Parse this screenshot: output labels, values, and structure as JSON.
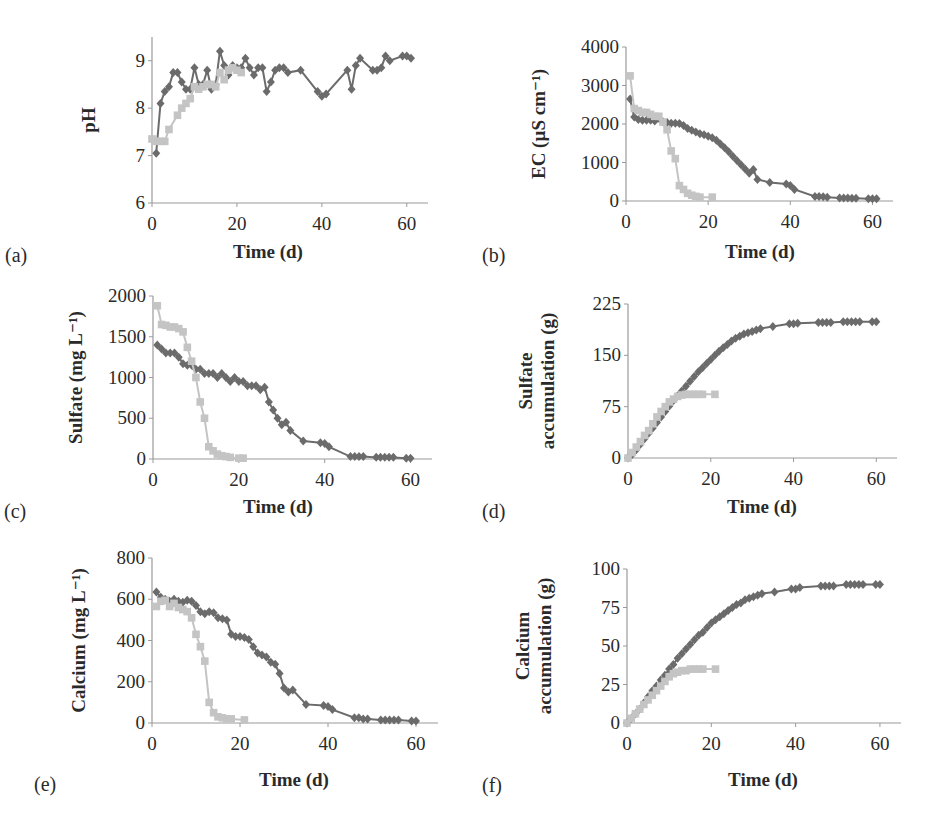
{
  "figure": {
    "series_styles": {
      "series1": {
        "color": "#6b6b6b",
        "marker": "diamond"
      },
      "series2": {
        "color": "#c4c4c4",
        "marker": "square"
      }
    }
  },
  "chart_data": [
    {
      "panel": "(a)",
      "type": "line",
      "title": "",
      "xlabel": "Time (d)",
      "ylabel": "pH",
      "ylabel_lines": [
        "pH"
      ],
      "xlim": [
        0,
        65
      ],
      "ylim": [
        6,
        9.5
      ],
      "xticks": [
        0,
        20,
        40,
        60
      ],
      "yticks": [
        6,
        7,
        8,
        9
      ],
      "grid": false,
      "legend": null,
      "series": [
        {
          "name": "series1",
          "x": [
            1,
            2,
            3,
            4,
            5,
            6,
            7,
            8,
            9,
            10,
            11,
            12,
            13,
            14,
            15,
            16,
            17,
            18,
            19,
            20,
            21,
            22,
            23,
            24,
            25,
            26,
            27,
            28,
            29,
            30,
            31,
            32,
            35,
            39,
            40,
            41,
            46,
            47,
            48,
            49,
            52,
            53,
            54,
            55,
            56,
            59,
            60,
            61
          ],
          "y": [
            7.05,
            8.1,
            8.35,
            8.45,
            8.75,
            8.75,
            8.55,
            8.4,
            8.4,
            8.85,
            8.5,
            8.5,
            8.8,
            8.4,
            8.5,
            9.2,
            8.9,
            8.7,
            8.9,
            8.85,
            8.85,
            9.05,
            8.85,
            8.7,
            8.85,
            8.85,
            8.35,
            8.55,
            8.8,
            8.85,
            8.85,
            8.75,
            8.8,
            8.35,
            8.25,
            8.3,
            8.8,
            8.4,
            8.9,
            9.05,
            8.8,
            8.8,
            8.85,
            9.1,
            9.0,
            9.1,
            9.1,
            9.05
          ]
        },
        {
          "name": "series2",
          "x": [
            0,
            1,
            2,
            3,
            4,
            6,
            7,
            8,
            9,
            10,
            11,
            12,
            13,
            14,
            15,
            16,
            17,
            18,
            19,
            20,
            21
          ],
          "y": [
            7.35,
            7.3,
            7.3,
            7.3,
            7.55,
            7.85,
            8.0,
            8.1,
            8.2,
            8.45,
            8.4,
            8.45,
            8.5,
            8.5,
            8.45,
            8.75,
            8.6,
            8.8,
            8.85,
            8.8,
            8.75
          ]
        }
      ]
    },
    {
      "panel": "(b)",
      "type": "line",
      "title": "",
      "xlabel": "Time (d)",
      "ylabel": "EC (µS cm-1)",
      "ylabel_lines": [
        "EC (µS cm⁻¹)"
      ],
      "xlim": [
        0,
        65
      ],
      "ylim": [
        0,
        4000
      ],
      "xticks": [
        0,
        20,
        40,
        60
      ],
      "yticks": [
        0,
        1000,
        2000,
        3000,
        4000
      ],
      "grid": false,
      "legend": null,
      "series": [
        {
          "name": "series1",
          "x": [
            1,
            2,
            3,
            4,
            5,
            6,
            7,
            9,
            10,
            11,
            12,
            13,
            14,
            15,
            16,
            17,
            18,
            19,
            20,
            21,
            22,
            23,
            24,
            25,
            26,
            27,
            28,
            29,
            30,
            31,
            32,
            35,
            39,
            40,
            41,
            46,
            47,
            48,
            49,
            52,
            53,
            54,
            55,
            56,
            59,
            60,
            61
          ],
          "y": [
            2650,
            2180,
            2120,
            2100,
            2100,
            2100,
            2080,
            2060,
            2040,
            2020,
            2020,
            2010,
            1960,
            1880,
            1840,
            1790,
            1750,
            1720,
            1680,
            1640,
            1580,
            1480,
            1380,
            1280,
            1160,
            1050,
            940,
            830,
            720,
            820,
            560,
            480,
            440,
            400,
            300,
            120,
            120,
            110,
            100,
            80,
            80,
            80,
            70,
            70,
            60,
            60,
            60
          ]
        },
        {
          "name": "series2",
          "x": [
            1,
            2,
            3,
            4,
            5,
            6,
            7,
            8,
            9,
            10,
            11,
            12,
            13,
            14,
            15,
            16,
            17,
            18,
            21
          ],
          "y": [
            3250,
            2400,
            2350,
            2300,
            2300,
            2250,
            2200,
            2200,
            2050,
            1850,
            1300,
            1100,
            400,
            300,
            200,
            150,
            120,
            100,
            100
          ]
        }
      ]
    },
    {
      "panel": "(c)",
      "type": "line",
      "title": "",
      "xlabel": "Time (d)",
      "ylabel": "Sulfate (mg L-1)",
      "ylabel_lines": [
        "Sulfate (mg L⁻¹)"
      ],
      "xlim": [
        0,
        65
      ],
      "ylim": [
        0,
        2000
      ],
      "xticks": [
        0,
        20,
        40,
        60
      ],
      "yticks": [
        0,
        500,
        1000,
        1500,
        2000
      ],
      "grid": false,
      "legend": null,
      "series": [
        {
          "name": "series1",
          "x": [
            1,
            2,
            3,
            4,
            5,
            6,
            7,
            8,
            9,
            10,
            11,
            12,
            13,
            14,
            15,
            16,
            17,
            18,
            19,
            20,
            21,
            22,
            23,
            24,
            25,
            26,
            27,
            28,
            29,
            30,
            31,
            32,
            35,
            39,
            40,
            41,
            46,
            47,
            48,
            49,
            52,
            53,
            54,
            55,
            56,
            59,
            60
          ],
          "y": [
            1400,
            1350,
            1300,
            1300,
            1300,
            1250,
            1170,
            1150,
            1150,
            1100,
            1100,
            1050,
            1050,
            1050,
            1000,
            1050,
            1000,
            950,
            1000,
            950,
            950,
            900,
            900,
            900,
            850,
            880,
            700,
            600,
            500,
            420,
            450,
            350,
            220,
            200,
            190,
            150,
            30,
            30,
            30,
            30,
            20,
            20,
            20,
            20,
            20,
            10,
            10
          ]
        },
        {
          "name": "series2",
          "x": [
            1,
            2,
            3,
            4,
            5,
            6,
            7,
            8,
            9,
            10,
            11,
            12,
            13,
            14,
            15,
            16,
            17,
            18,
            20,
            21
          ],
          "y": [
            1880,
            1650,
            1640,
            1620,
            1620,
            1600,
            1560,
            1370,
            1200,
            1000,
            700,
            500,
            150,
            100,
            60,
            40,
            30,
            20,
            10,
            10
          ]
        }
      ]
    },
    {
      "panel": "(d)",
      "type": "line",
      "title": "",
      "xlabel": "Time (d)",
      "ylabel": "Sulfate accumulation (g)",
      "ylabel_lines": [
        "Sulfate",
        "accumulation (g)"
      ],
      "xlim": [
        0,
        65
      ],
      "ylim": [
        0,
        225
      ],
      "xticks": [
        0,
        20,
        40,
        60
      ],
      "yticks": [
        0,
        75,
        150,
        225
      ],
      "grid": false,
      "legend": null,
      "series": [
        {
          "name": "series1",
          "x": [
            0,
            1,
            2,
            3,
            4,
            5,
            6,
            7,
            8,
            9,
            10,
            11,
            12,
            13,
            14,
            15,
            16,
            17,
            18,
            19,
            20,
            21,
            22,
            23,
            24,
            25,
            26,
            27,
            28,
            29,
            30,
            31,
            32,
            35,
            39,
            40,
            41,
            46,
            47,
            48,
            49,
            52,
            53,
            54,
            55,
            56,
            59,
            60
          ],
          "y": [
            0,
            5,
            12,
            20,
            28,
            36,
            44,
            52,
            60,
            68,
            76,
            84,
            91,
            98,
            105,
            112,
            119,
            126,
            132,
            138,
            144,
            150,
            156,
            161,
            166,
            171,
            175,
            178,
            181,
            183,
            185,
            187,
            189,
            192,
            196,
            196,
            197,
            198,
            198,
            198,
            198,
            199,
            199,
            199,
            199,
            199,
            199,
            199
          ]
        },
        {
          "name": "series2",
          "x": [
            0,
            1,
            2,
            3,
            4,
            5,
            6,
            7,
            8,
            9,
            10,
            11,
            12,
            13,
            14,
            15,
            16,
            17,
            18,
            21
          ],
          "y": [
            0,
            8,
            16,
            24,
            33,
            40,
            50,
            60,
            68,
            75,
            82,
            86,
            90,
            92,
            93,
            93,
            93,
            93,
            93,
            93
          ]
        }
      ]
    },
    {
      "panel": "(e)",
      "type": "line",
      "title": "",
      "xlabel": "Time (d)",
      "ylabel": "Calcium (mg L-1)",
      "ylabel_lines": [
        "Calcium (mg L⁻¹)"
      ],
      "xlim": [
        0,
        65
      ],
      "ylim": [
        0,
        800
      ],
      "xticks": [
        0,
        20,
        40,
        60
      ],
      "yticks": [
        0,
        200,
        400,
        600,
        800
      ],
      "grid": false,
      "legend": null,
      "series": [
        {
          "name": "series1",
          "x": [
            1,
            2,
            3,
            4,
            5,
            6,
            7,
            8,
            9,
            10,
            11,
            12,
            13,
            14,
            15,
            16,
            17,
            18,
            19,
            20,
            21,
            22,
            23,
            24,
            25,
            26,
            27,
            28,
            29,
            30,
            31,
            32,
            35,
            39,
            40,
            41,
            46,
            47,
            48,
            49,
            52,
            53,
            54,
            55,
            56,
            59,
            60
          ],
          "y": [
            635,
            610,
            600,
            590,
            600,
            590,
            585,
            595,
            590,
            570,
            540,
            530,
            540,
            535,
            510,
            505,
            500,
            430,
            420,
            420,
            415,
            405,
            370,
            340,
            330,
            320,
            295,
            285,
            240,
            170,
            150,
            160,
            90,
            85,
            80,
            65,
            25,
            25,
            20,
            20,
            15,
            15,
            15,
            15,
            15,
            10,
            10
          ]
        },
        {
          "name": "series2",
          "x": [
            1,
            2,
            3,
            4,
            5,
            6,
            7,
            8,
            9,
            10,
            11,
            12,
            13,
            14,
            15,
            16,
            17,
            18,
            21
          ],
          "y": [
            565,
            590,
            595,
            565,
            580,
            560,
            550,
            540,
            510,
            430,
            370,
            300,
            100,
            50,
            30,
            25,
            20,
            20,
            15
          ]
        }
      ]
    },
    {
      "panel": "(f)",
      "type": "line",
      "title": "",
      "xlabel": "Time (d)",
      "ylabel": "Calcium accumulation (g)",
      "ylabel_lines": [
        "Calcium",
        "accumulation (g)"
      ],
      "xlim": [
        0,
        65
      ],
      "ylim": [
        0,
        100
      ],
      "xticks": [
        0,
        20,
        40,
        60
      ],
      "yticks": [
        0,
        25,
        50,
        75,
        100
      ],
      "grid": false,
      "legend": null,
      "series": [
        {
          "name": "series1",
          "x": [
            0,
            1,
            2,
            3,
            4,
            5,
            6,
            7,
            8,
            9,
            10,
            11,
            12,
            13,
            14,
            15,
            16,
            17,
            18,
            19,
            20,
            21,
            22,
            23,
            24,
            25,
            26,
            27,
            28,
            29,
            30,
            31,
            32,
            35,
            39,
            40,
            41,
            46,
            47,
            48,
            49,
            52,
            53,
            54,
            55,
            56,
            59,
            60
          ],
          "y": [
            0,
            3,
            6,
            9,
            13,
            17,
            21,
            24,
            28,
            31,
            35,
            38,
            42,
            45,
            48,
            51,
            54,
            57,
            59,
            62,
            65,
            67,
            69,
            71,
            73,
            75,
            77,
            78,
            80,
            81,
            82,
            83,
            84,
            85,
            87,
            87,
            88,
            89,
            89,
            89,
            89,
            90,
            90,
            90,
            90,
            90,
            90,
            90
          ]
        },
        {
          "name": "series2",
          "x": [
            0,
            1,
            2,
            3,
            4,
            5,
            6,
            7,
            8,
            9,
            10,
            11,
            12,
            13,
            14,
            15,
            16,
            17,
            18,
            21
          ],
          "y": [
            0,
            3,
            6,
            9,
            12,
            15,
            18,
            21,
            24,
            27,
            30,
            32,
            33,
            34,
            34,
            35,
            35,
            35,
            35,
            35
          ]
        }
      ]
    }
  ]
}
